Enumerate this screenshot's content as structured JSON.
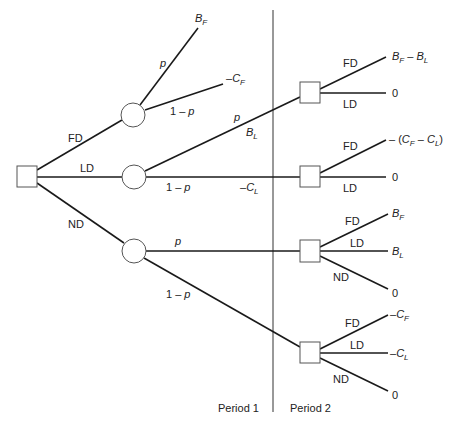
{
  "diagram": {
    "type": "decision-tree",
    "colors": {
      "line": "#1a1a1a",
      "node_stroke": "#555555",
      "background": "#ffffff"
    },
    "periods": {
      "period1": "Period 1",
      "period2": "Period 2"
    },
    "root": {
      "shape": "square",
      "branches": {
        "fd": "FD",
        "ld": "LD",
        "nd": "ND"
      }
    },
    "chance_nodes": [
      {
        "id": "after-fd",
        "shape": "circle",
        "branches": [
          {
            "prob": "p",
            "payoff_main": "B",
            "payoff_sub": "F",
            "payoff_prefix": ""
          },
          {
            "prob": "1 − p",
            "payoff_main": "C",
            "payoff_sub": "F",
            "payoff_prefix": "–"
          }
        ]
      },
      {
        "id": "after-ld",
        "shape": "circle",
        "branches": [
          {
            "prob": "p",
            "value_main": "B",
            "value_sub": "L"
          },
          {
            "prob": "1 − p",
            "value_main": "C",
            "value_sub": "L",
            "value_prefix": "–"
          }
        ]
      },
      {
        "id": "after-nd",
        "shape": "circle",
        "branches": [
          {
            "prob": "p"
          },
          {
            "prob": "1 − p"
          }
        ]
      }
    ],
    "period2_decisions": [
      {
        "shape": "square",
        "branches": [
          {
            "label": "FD",
            "payoff": "B_F − B_L"
          },
          {
            "label": "LD",
            "payoff": "0"
          }
        ]
      },
      {
        "shape": "square",
        "branches": [
          {
            "label": "FD",
            "payoff": "− (C_F − C_L)"
          },
          {
            "label": "LD",
            "payoff": "0"
          }
        ]
      },
      {
        "shape": "square",
        "branches": [
          {
            "label": "FD",
            "payoff_main": "B",
            "payoff_sub": "F"
          },
          {
            "label": "LD",
            "payoff_main": "B",
            "payoff_sub": "L"
          },
          {
            "label": "ND",
            "payoff": "0"
          }
        ]
      },
      {
        "shape": "square",
        "branches": [
          {
            "label": "FD",
            "payoff_prefix": "–",
            "payoff_main": "C",
            "payoff_sub": "F"
          },
          {
            "label": "LD",
            "payoff_prefix": "–",
            "payoff_main": "C",
            "payoff_sub": "L"
          },
          {
            "label": "ND",
            "payoff": "0"
          }
        ]
      }
    ],
    "text": {
      "minus": "–",
      "minus_space": "− ",
      "open_paren": "(",
      "close_paren": ")",
      "dash": " – ",
      "B": "B",
      "C": "C",
      "F": "F",
      "L": "L",
      "zero": "0"
    }
  }
}
